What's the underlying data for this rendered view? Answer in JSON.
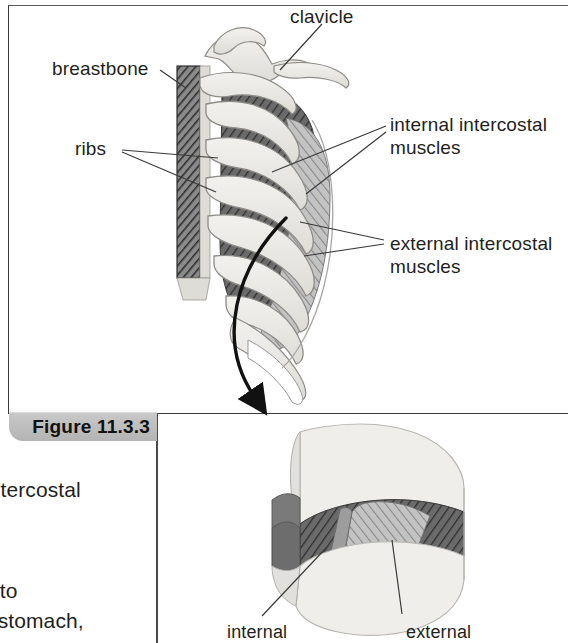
{
  "figure": {
    "number_label": "Figure 11.3.3",
    "frame": {
      "accent_color": "#bdbdbd",
      "border_color": "#3c3c3c"
    }
  },
  "page_text_fragments": [
    {
      "id": "frag-intercostal",
      "text": "intercostal"
    },
    {
      "id": "frag-eto",
      "text": "e to"
    },
    {
      "id": "frag-stomach",
      "text": "d stomach,"
    }
  ],
  "callouts": {
    "clavicle": {
      "label": "clavicle"
    },
    "breastbone": {
      "label": "breastbone"
    },
    "ribs": {
      "label": "ribs"
    },
    "internal_intercostal": {
      "line1": "internal intercostal",
      "line2": "muscles"
    },
    "external_intercostal": {
      "line1": "external intercostal",
      "line2": "muscles"
    },
    "detail_internal": {
      "label": "internal"
    },
    "detail_external": {
      "label": "external"
    }
  },
  "illustration": {
    "title": "rib cage with intercostal muscles and magnified intercostal space",
    "parts": [
      "sternum (breastbone)",
      "ribs",
      "clavicle",
      "internal intercostal muscles",
      "external intercostal muscles"
    ],
    "colors": {
      "bone_fill": "#eceae6",
      "bone_outline": "#8e8c88",
      "muscle_dark": "#5d5d5d",
      "muscle_light": "#b8b8b8",
      "sternum_hatch": "#4a4a4a",
      "arrow": "#111111",
      "leader_line": "#3a3a3a"
    }
  }
}
